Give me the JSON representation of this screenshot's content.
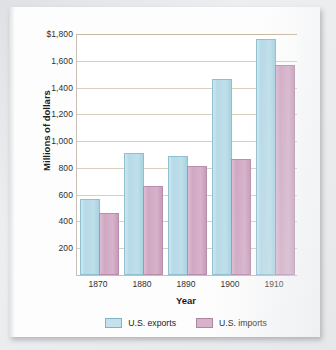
{
  "chart_data": {
    "type": "bar",
    "title": "",
    "xlabel": "Year",
    "ylabel": "Millions of dollars",
    "categories": [
      "1870",
      "1880",
      "1890",
      "1900",
      "1910"
    ],
    "series": [
      {
        "name": "U.S. exports",
        "color": "#bfdfea",
        "values": [
          550,
          900,
          875,
          1450,
          1750
        ]
      },
      {
        "name": "U.S. imports",
        "color": "#d5aec6",
        "values": [
          450,
          650,
          800,
          850,
          1550
        ]
      }
    ],
    "ylim": [
      0,
      1800
    ],
    "ytick_values": [
      200,
      400,
      600,
      800,
      1000,
      1200,
      1400,
      1600,
      1800
    ],
    "ytick_labels": [
      "200",
      "400",
      "600",
      "800",
      "1,000",
      "1,200",
      "1,400",
      "1,600",
      "$1,800"
    ],
    "grid": true,
    "legend_position": "bottom"
  },
  "legend": {
    "items": [
      {
        "label": "U.S. exports"
      },
      {
        "label": "U.S. imports"
      }
    ]
  },
  "colors": {
    "exports": "#bfdfea",
    "imports": "#d5aec6",
    "gridline": "#d9cfbd",
    "axis": "#c9bfae",
    "page": "#fdfdfd"
  }
}
